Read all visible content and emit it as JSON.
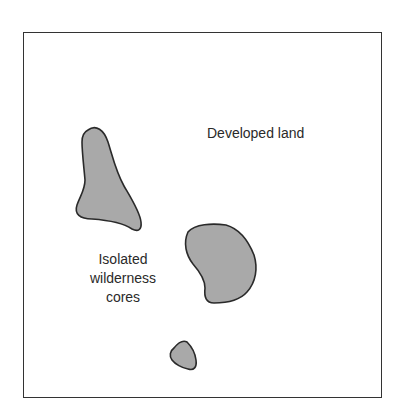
{
  "diagram": {
    "labels": {
      "developed_land": "Developed land",
      "cores_line1": "Isolated",
      "cores_line2": "wilderness",
      "cores_line3": "cores"
    },
    "colors": {
      "background": "#ffffff",
      "frame": "#333333",
      "core_fill": "#a9a9a9",
      "core_stroke": "#2a2a2a"
    },
    "regions": [
      {
        "name": "wilderness-core-1",
        "shape": "elongated triangular blob"
      },
      {
        "name": "wilderness-core-2",
        "shape": "rounded blob"
      },
      {
        "name": "wilderness-core-3",
        "shape": "small pentagonal blob"
      }
    ]
  }
}
